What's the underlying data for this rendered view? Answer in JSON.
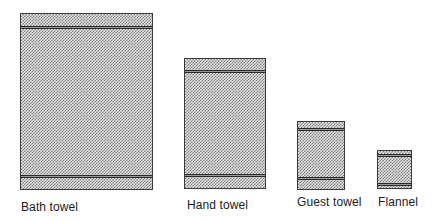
{
  "figure": {
    "towels": [
      {
        "label": "Bath towel"
      },
      {
        "label": "Hand towel"
      },
      {
        "label": "Guest towel"
      },
      {
        "label": "Flannel"
      }
    ]
  }
}
